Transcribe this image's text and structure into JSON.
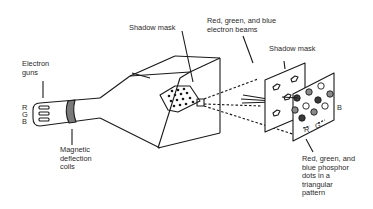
{
  "diagram": {
    "labels": {
      "electron_guns": "Electron\nguns",
      "gun_r": "R",
      "gun_g": "G",
      "gun_b": "B",
      "magnetic_coils": "Magnetic\ndeflection\ncoils",
      "shadow_mask_tube": "Shadow mask",
      "electron_beams": "Red, green, and blue\nelectron beams",
      "shadow_mask_detail": "Shadow mask",
      "phosphor_dots": "Red, green, and\nblue phosphor\ndots in a\ntriangular\npattern",
      "dot_r": "R",
      "dot_g": "G",
      "dot_b": "B"
    },
    "colors": {
      "stroke": "#1a1a1a",
      "coil": "#7a7a7a",
      "dot_red": "#3a3a3a",
      "dot_green": "#8a8a8a",
      "dot_blue": "#ffffff"
    }
  }
}
